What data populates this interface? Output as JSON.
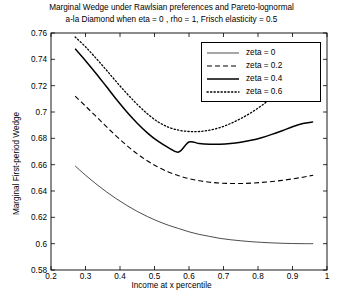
{
  "chart_data": {
    "type": "line",
    "title": "Marginal Wedge under Rawlsian preferences and Pareto-lognormal a-la Diamond when eta = 0 , rho = 1, Frisch elasticity = 0.5",
    "title_line1": "Marginal Wedge under Rawlsian preferences and Pareto-lognormal",
    "title_line2": "a-la Diamond when eta = 0 , rho = 1, Frisch elasticity = 0.5",
    "xlabel": "Income at x percentile",
    "ylabel": "Marginal First-period Wedge",
    "xlim": [
      0.2,
      1.0
    ],
    "ylim": [
      0.58,
      0.76
    ],
    "xticks": [
      "0.2",
      "0.3",
      "0.4",
      "0.5",
      "0.6",
      "0.7",
      "0.8",
      "0.9",
      "1"
    ],
    "xtick_values": [
      0.2,
      0.3,
      0.4,
      0.5,
      0.6,
      0.7,
      0.8,
      0.9,
      1.0
    ],
    "yticks": [
      "0.58",
      "0.6",
      "0.62",
      "0.64",
      "0.66",
      "0.68",
      "0.7",
      "0.72",
      "0.74",
      "0.76"
    ],
    "ytick_values": [
      0.58,
      0.6,
      0.62,
      0.64,
      0.66,
      0.68,
      0.7,
      0.72,
      0.74,
      0.76
    ],
    "grid": false,
    "legend_position": "upper right",
    "legend_entries": [
      "zeta = 0",
      "zeta = 0.2",
      "zeta = 0.4",
      "zeta = 0.6"
    ],
    "x": [
      0.27,
      0.3,
      0.33,
      0.36,
      0.39,
      0.42,
      0.45,
      0.48,
      0.51,
      0.54,
      0.57,
      0.6,
      0.63,
      0.66,
      0.69,
      0.72,
      0.75,
      0.78,
      0.81,
      0.84,
      0.87,
      0.9,
      0.93,
      0.96
    ],
    "series": [
      {
        "name": "zeta = 0",
        "style": "solid-thin",
        "color": "#000000",
        "values": [
          0.659,
          0.652,
          0.6455,
          0.6395,
          0.634,
          0.629,
          0.6245,
          0.6205,
          0.617,
          0.614,
          0.6115,
          0.609,
          0.607,
          0.6055,
          0.604,
          0.603,
          0.6022,
          0.6015,
          0.601,
          0.6006,
          0.6003,
          0.6001,
          0.6,
          0.6
        ]
      },
      {
        "name": "zeta = 0.2",
        "style": "dashed",
        "color": "#000000",
        "values": [
          0.712,
          0.7045,
          0.6968,
          0.689,
          0.6815,
          0.6745,
          0.6682,
          0.6628,
          0.6582,
          0.6545,
          0.6516,
          0.6494,
          0.6478,
          0.6467,
          0.646,
          0.6457,
          0.6457,
          0.646,
          0.6465,
          0.6472,
          0.6481,
          0.6492,
          0.6505,
          0.652
        ]
      },
      {
        "name": "zeta = 0.4",
        "style": "solid-thick",
        "color": "#000000",
        "values": [
          0.748,
          0.739,
          0.7295,
          0.7195,
          0.7095,
          0.7,
          0.6915,
          0.684,
          0.6778,
          0.673,
          0.6696,
          0.6772,
          0.676,
          0.6755,
          0.6755,
          0.676,
          0.677,
          0.6785,
          0.6805,
          0.683,
          0.6858,
          0.6888,
          0.6912,
          0.6925
        ]
      },
      {
        "name": "zeta = 0.6",
        "style": "dotted",
        "color": "#000000",
        "values": [
          0.757,
          0.7495,
          0.741,
          0.732,
          0.7228,
          0.714,
          0.7058,
          0.6985,
          0.6925,
          0.6885,
          0.6862,
          0.6852,
          0.6852,
          0.6862,
          0.6882,
          0.6912,
          0.695,
          0.6995,
          0.7048,
          0.7108,
          0.7175,
          0.7248,
          0.732,
          0.7378
        ]
      }
    ]
  }
}
